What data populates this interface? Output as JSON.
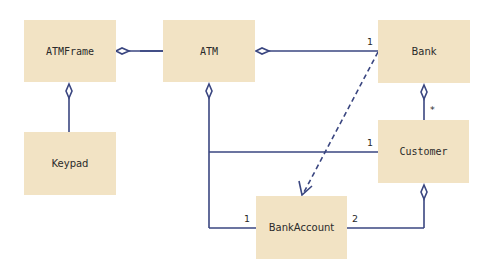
{
  "diagram": {
    "type": "UML class diagram",
    "classes": [
      {
        "id": "atmframe",
        "label": "ATMFrame",
        "x": 24,
        "y": 20,
        "w": 92,
        "h": 62,
        "font": "mono"
      },
      {
        "id": "atm",
        "label": "ATM",
        "x": 163,
        "y": 20,
        "w": 92,
        "h": 62,
        "font": "mono"
      },
      {
        "id": "bank",
        "label": "Bank",
        "x": 378,
        "y": 20,
        "w": 92,
        "h": 63,
        "font": "sans"
      },
      {
        "id": "keypad",
        "label": "Keypad",
        "x": 24,
        "y": 132,
        "w": 92,
        "h": 63,
        "font": "sans"
      },
      {
        "id": "customer",
        "label": "Customer",
        "x": 378,
        "y": 120,
        "w": 91,
        "h": 63,
        "font": "mono"
      },
      {
        "id": "bankaccount",
        "label": "BankAccount",
        "x": 256,
        "y": 196,
        "w": 91,
        "h": 63,
        "font": "sans"
      }
    ],
    "multiplicities": {
      "atm_bank": "1",
      "bank_customer": "*",
      "atm_customer": "1",
      "atm_bankaccount": "1",
      "customer_bankaccount": "2"
    },
    "colors": {
      "box_fill": "#f2e3c4",
      "line": "#3a4680",
      "text": "#2a2a2a"
    }
  }
}
